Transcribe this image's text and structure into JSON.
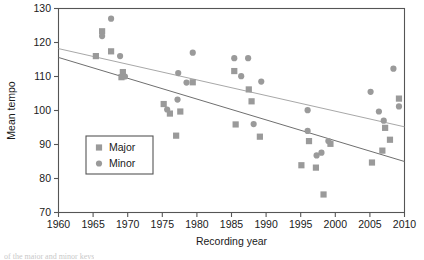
{
  "chart_data": {
    "type": "scatter",
    "title": "",
    "xlabel": "Recording year",
    "ylabel": "Mean tempo",
    "xlim": [
      1960,
      2010
    ],
    "ylim": [
      70,
      130
    ],
    "xticks": [
      1960,
      1965,
      1970,
      1975,
      1980,
      1985,
      1990,
      1995,
      2000,
      2005,
      2010
    ],
    "yticks": [
      70,
      80,
      90,
      100,
      110,
      120,
      130
    ],
    "grid": false,
    "legend_position": "lower-left-inside",
    "marker_color": "#9a9a9a",
    "axis_color": "#555555",
    "series": [
      {
        "name": "Major",
        "marker": "square",
        "color": "#9a9a9a",
        "points": [
          [
            1965.4,
            116.0
          ],
          [
            1966.3,
            123.3
          ],
          [
            1967.6,
            117.4
          ],
          [
            1969.3,
            111.3
          ],
          [
            1969.1,
            109.8
          ],
          [
            1975.2,
            101.9
          ],
          [
            1976.1,
            99.1
          ],
          [
            1977.6,
            99.7
          ],
          [
            1977.0,
            92.6
          ],
          [
            1979.4,
            108.3
          ],
          [
            1985.4,
            111.6
          ],
          [
            1985.6,
            95.9
          ],
          [
            1987.5,
            106.2
          ],
          [
            1987.9,
            102.7
          ],
          [
            1989.1,
            92.3
          ],
          [
            1995.1,
            83.9
          ],
          [
            1996.2,
            91.0
          ],
          [
            1997.2,
            83.2
          ],
          [
            1998.3,
            75.3
          ],
          [
            1999.3,
            90.2
          ],
          [
            2005.3,
            84.7
          ],
          [
            2006.8,
            88.2
          ],
          [
            2007.2,
            94.9
          ],
          [
            2007.9,
            91.4
          ],
          [
            2009.2,
            103.5
          ]
        ]
      },
      {
        "name": "Minor",
        "marker": "circle",
        "color": "#9a9a9a",
        "points": [
          [
            1966.3,
            121.9
          ],
          [
            1967.6,
            127.0
          ],
          [
            1968.9,
            116.0
          ],
          [
            1969.6,
            110.0
          ],
          [
            1975.7,
            100.3
          ],
          [
            1977.2,
            103.2
          ],
          [
            1978.5,
            108.2
          ],
          [
            1979.4,
            117.0
          ],
          [
            1977.3,
            111.0
          ],
          [
            1985.4,
            115.4
          ],
          [
            1986.4,
            110.1
          ],
          [
            1987.4,
            115.4
          ],
          [
            1988.2,
            96.0
          ],
          [
            1989.3,
            108.5
          ],
          [
            1996.0,
            100.1
          ],
          [
            1996.0,
            94.0
          ],
          [
            1997.3,
            86.8
          ],
          [
            1998.0,
            87.6
          ],
          [
            1999.0,
            91.0
          ],
          [
            2005.1,
            105.5
          ],
          [
            2006.3,
            99.7
          ],
          [
            2007.0,
            97.0
          ],
          [
            2008.4,
            112.3
          ],
          [
            2009.2,
            101.2
          ]
        ]
      }
    ],
    "fit_lines": [
      {
        "name": "Major trend",
        "color": "#a8a8a8",
        "x0": 1960,
        "y0": 118.2,
        "x1": 2010,
        "y1": 95.2
      },
      {
        "name": "Minor trend",
        "color": "#6f6f6f",
        "x0": 1960,
        "y0": 115.6,
        "x1": 2010,
        "y1": 85.0
      }
    ]
  },
  "legend": {
    "items": [
      {
        "label": "Major",
        "marker": "square"
      },
      {
        "label": "Minor",
        "marker": "circle"
      }
    ]
  },
  "caption": {
    "sliver_text": "of the major and minor keys"
  }
}
